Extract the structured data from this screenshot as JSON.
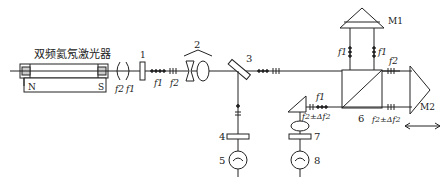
{
  "laser": {
    "title": "双频氦氖激光器",
    "magnet_n": "N",
    "magnet_s": "S"
  },
  "frequencies": {
    "f1": "f1",
    "f2": "f2",
    "f2_shift": "f2±Δf2"
  },
  "components": {
    "c1": "1",
    "c2": "2",
    "c3": "3",
    "c4": "4",
    "c5": "5",
    "c6": "6",
    "c7": "7",
    "c8": "8",
    "m1": "M1",
    "m2": "M2"
  },
  "labels": {
    "circ_f2": "f2",
    "circ_f1": "f1",
    "beam_f1_a": "f1",
    "beam_f2_a": "f2",
    "up_f1_left": "f1",
    "up_f1_right": "f1",
    "right_f2": "f2",
    "lower_f1": "f1",
    "lower_f2d": "f2±Δf2",
    "bottom_f2d": "f2±Δf2"
  },
  "colors": {
    "line": "#222222",
    "background": "#ffffff"
  }
}
